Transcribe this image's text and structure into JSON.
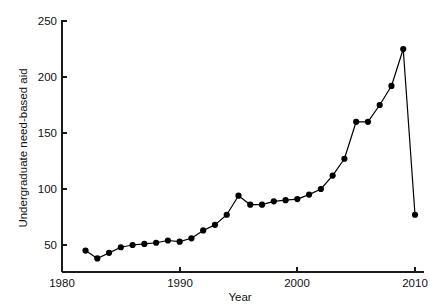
{
  "chart_data": {
    "type": "line",
    "title": "",
    "xlabel": "Year",
    "ylabel": "Undergraduate need-based aid",
    "xlim": [
      1979.5,
      2011.5
    ],
    "ylim": [
      25,
      262
    ],
    "grid": false,
    "legend": null,
    "xticks": [
      1980,
      1990,
      2000,
      2010
    ],
    "xtick_labels": [
      "1980",
      "1990",
      "2000",
      "2010"
    ],
    "yticks": [
      50,
      100,
      150,
      200,
      250
    ],
    "ytick_labels": [
      "50",
      "100",
      "150",
      "200",
      "250"
    ],
    "marker": "filled-circle",
    "series": [
      {
        "name": "Undergraduate need-based aid",
        "color": "#000000",
        "x": [
          1982,
          1983,
          1984,
          1985,
          1986,
          1987,
          1988,
          1989,
          1990,
          1991,
          1992,
          1993,
          1994,
          1995,
          1996,
          1997,
          1998,
          1999,
          2000,
          2001,
          2002,
          2003,
          2004,
          2005,
          2006,
          2007,
          2008,
          2009,
          2010
        ],
        "y": [
          45,
          38,
          43,
          48,
          50,
          51,
          52,
          54,
          53,
          56,
          63,
          68,
          77,
          94,
          86,
          86,
          89,
          90,
          91,
          95,
          100,
          112,
          127,
          160,
          160,
          175,
          192,
          225,
          77
        ]
      }
    ]
  },
  "axes": {
    "y_label": "Undergraduate need-based aid",
    "x_label": "Year"
  }
}
